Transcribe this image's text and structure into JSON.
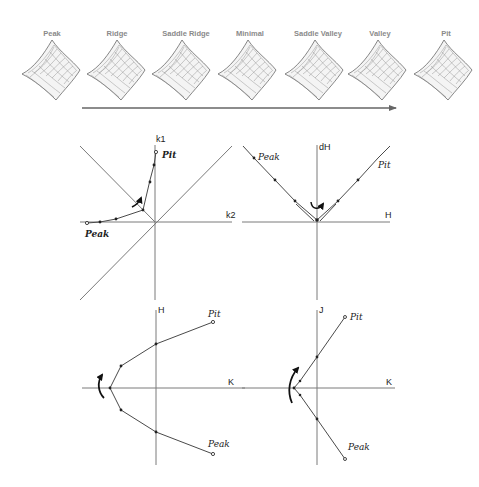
{
  "figure": {
    "surface_sequence": {
      "labels": [
        "Peak",
        "Ridge",
        "Saddle Ridge",
        "Minimal",
        "Saddle Valley",
        "Valley",
        "Pit"
      ],
      "label_color": "#8a8a8a",
      "progression_arrow": "arrow-right"
    },
    "plots": [
      {
        "id": "k1-k2",
        "x_axis": "k2",
        "y_axis": "k1",
        "start_label": "Peak",
        "end_label": "Pit",
        "has_diagonals": true,
        "rotation_arrow": "curved-arrow"
      },
      {
        "id": "dH-H",
        "x_axis": "H",
        "y_axis": "dH",
        "start_label": "Peak",
        "end_label": "Pit",
        "rotation_arrow": "curved-arrow"
      },
      {
        "id": "H-K",
        "x_axis": "K",
        "y_axis": "H",
        "start_label": "Peak",
        "end_label": "Pit",
        "rotation_arrow": "curved-arrow"
      },
      {
        "id": "J-K",
        "x_axis": "K",
        "y_axis": "J",
        "start_label": "Peak",
        "end_label": "Pit",
        "rotation_arrow": "curved-arrow"
      }
    ],
    "colors": {
      "axis": "#7a7a7a",
      "curve": "#4a4a4a",
      "ink": "#222222"
    }
  }
}
